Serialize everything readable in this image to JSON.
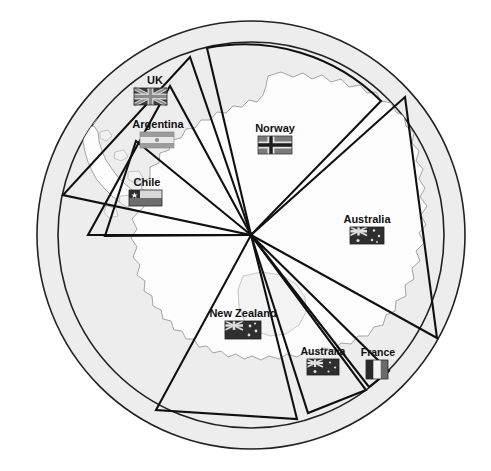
{
  "figure": {
    "background_color": "#ffffff",
    "ocean_color": "#ededed",
    "land_color": "#fdfdfd",
    "line_color": "#101010",
    "center_point": {
      "x": 251,
      "y": 235,
      "name": "south-pole"
    },
    "outer_radius": 214,
    "inner_radius": 193
  },
  "claims": [
    {
      "id": "uk",
      "label": "UK",
      "flag": "union-jack",
      "label_x": 155,
      "label_y": 84,
      "flag_x": 155,
      "flag_y": 92,
      "start_angle": 200,
      "end_angle": 260,
      "radius": 203
    },
    {
      "id": "argentina",
      "label": "Argentina",
      "flag": "argentina-flag",
      "label_x": 158,
      "label_y": 128,
      "flag_x": 158,
      "flag_y": 136,
      "start_angle": 205,
      "end_angle": 250,
      "radius": 182
    },
    {
      "id": "chile",
      "label": "Chile",
      "flag": "chile-flag",
      "label_x": 147,
      "label_y": 186,
      "flag_x": 147,
      "flag_y": 194,
      "start_angle": 208,
      "end_angle": 243,
      "radius": 160
    },
    {
      "id": "norway",
      "label": "Norway",
      "flag": "norway-flag",
      "label_x": 275,
      "label_y": 132,
      "flag_x": 275,
      "flag_y": 140,
      "start_angle": 270,
      "end_angle": 340,
      "radius": 193
    },
    {
      "id": "australia-east",
      "label": "Australia",
      "flag": "australia-flag",
      "label_x": 367,
      "label_y": 223,
      "flag_x": 367,
      "flag_y": 231,
      "start_angle": 341,
      "end_angle": 42,
      "radius": 193
    },
    {
      "id": "france",
      "label": "France",
      "flag": "france-flag",
      "label_x": 378,
      "label_y": 356,
      "flag_x": 378,
      "flag_y": 364,
      "start_angle": 43,
      "end_angle": 49,
      "radius": 193
    },
    {
      "id": "australia-west",
      "label": "Australia",
      "flag": "australia-flag",
      "label_x": 323,
      "label_y": 355,
      "flag_x": 323,
      "flag_y": 363,
      "start_angle": 50,
      "end_angle": 74,
      "radius": 193
    },
    {
      "id": "new-zealand",
      "label": "New Zealand",
      "flag": "new-zealand-flag",
      "label_x": 243,
      "label_y": 317,
      "flag_x": 243,
      "flag_y": 325,
      "start_angle": 78,
      "end_angle": 125,
      "radius": 193
    }
  ],
  "flag_colors": {
    "uk_blue": "#3b3b3b",
    "uk_white": "#cfcfcf",
    "uk_red": "#8a8a8a",
    "argentina_blue": "#9c9c9c",
    "argentina_white": "#e8e8e8",
    "chile_white": "#d8d8d8",
    "chile_blue": "#303030",
    "chile_red": "#6d6d6d",
    "norway_red": "#7a7a7a",
    "norway_white": "#e2e2e2",
    "norway_blue": "#1c1c1c",
    "australia_blue": "#2f2f2f",
    "australia_white": "#e0e0e0",
    "nz_blue": "#2f2f2f",
    "nz_white": "#dcdcdc",
    "france_blue": "#2a2a2a",
    "france_white": "#f2f2f2",
    "france_red": "#6a6a6a"
  },
  "map_data": {
    "type": "polar-sector-map",
    "projection": "south-polar-azimuthal",
    "description": "Circular south-polar map of Antarctica showing eight overlapping pie-wedge territorial claim sectors radiating from the South Pole, each labelled with a country name and national flag."
  }
}
